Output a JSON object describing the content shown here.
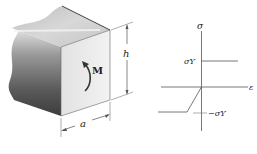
{
  "figure": {
    "left_panel": {
      "description": "Square cross-section beam segment under bending moment",
      "moment_label": "M",
      "height_label": "h",
      "width_label": "a"
    },
    "right_panel": {
      "description": "Elastic-perfectly plastic stress-strain diagram",
      "y_axis_label": "σ",
      "x_axis_label": "ε",
      "yield_positive_label": "σY",
      "yield_negative_label": "−σY"
    }
  },
  "colors": {
    "line": "#555555",
    "text": "#222222",
    "face_front": "#ececec",
    "face_side_dark": "#4a4a4a",
    "face_top": "#d8d8d8"
  }
}
